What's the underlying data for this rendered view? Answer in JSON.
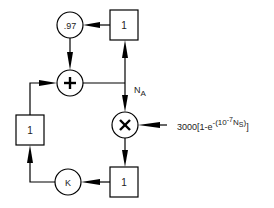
{
  "diagram": {
    "nodes": {
      "gain_097": {
        "label": ".97",
        "shape": "circle"
      },
      "box_top": {
        "label": "1",
        "shape": "box"
      },
      "sum": {
        "label": "+",
        "shape": "circle",
        "icon": "plus-icon"
      },
      "mult": {
        "label": "×",
        "shape": "circle",
        "icon": "multiply-icon"
      },
      "box_left": {
        "label": "1",
        "shape": "box"
      },
      "box_bottom": {
        "label": "1",
        "shape": "box"
      },
      "gain_k": {
        "label": "K",
        "shape": "circle"
      }
    },
    "signal_label": {
      "main": "N",
      "sub": "A"
    },
    "input_expr": {
      "prefix": "3000[1-e",
      "sup_open": "-(10",
      "sup_exp": "-7",
      "sup_var": "N",
      "sup_var_sub": "S",
      "sup_close": ")",
      "suffix": "]"
    },
    "colors": {
      "stroke": "#000000",
      "background": "#ffffff"
    }
  }
}
